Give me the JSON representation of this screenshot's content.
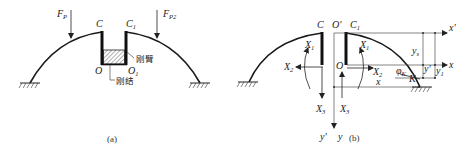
{
  "figure_a": {
    "caption": "(a)",
    "load_left": {
      "main": "F",
      "sub": "P"
    },
    "load_right": {
      "main": "F",
      "sub": "P2"
    },
    "node_c": "C",
    "node_c1": {
      "main": "C",
      "sub": "1"
    },
    "node_o": "O",
    "node_o1": {
      "main": "O",
      "sub": "1"
    },
    "rigid_arm_label": "刚臂",
    "rigid_joint_label": "刚结"
  },
  "figure_b": {
    "caption": "(b)",
    "node_c": "C",
    "node_o_prime": "O'",
    "node_c1": {
      "main": "C",
      "sub": "1"
    },
    "node_o": "O",
    "left_x1": {
      "main": "X",
      "sub": "1"
    },
    "left_x2": {
      "main": "X",
      "sub": "2"
    },
    "left_x3": {
      "main": "X",
      "sub": "3"
    },
    "right_x1": {
      "main": "X",
      "sub": "1"
    },
    "right_x2": {
      "main": "X",
      "sub": "2"
    },
    "right_x3": {
      "main": "X",
      "sub": "3"
    },
    "axis_x_prime": "x'",
    "axis_x": "x",
    "axis_y_prime": "y'",
    "axis_y": "y",
    "dim_ys": {
      "main": "y",
      "sub": "s"
    },
    "dim_y": "y'",
    "dim_y1": {
      "main": "y",
      "sub": "1"
    },
    "dim_x": "x",
    "angle": {
      "main": "φ",
      "sub": "K"
    },
    "point_k": "K"
  }
}
